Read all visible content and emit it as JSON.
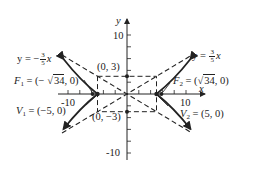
{
  "diagram": {
    "type": "hyperbola",
    "equation_params": {
      "a": 5,
      "b": 3,
      "c": "sqrt(34)",
      "transverse_axis": "x"
    },
    "axes": {
      "x_label": "x",
      "y_label": "y",
      "x_ticks": [
        "-10",
        "10"
      ],
      "y_ticks": [
        "10",
        "-10"
      ]
    },
    "asymptotes": {
      "left": {
        "prefix": "y = −",
        "num": "3",
        "den": "5",
        "suffix": "x"
      },
      "right": {
        "prefix": "y = ",
        "num": "3",
        "den": "5",
        "suffix": "x"
      }
    },
    "points": {
      "top": "(0, 3)",
      "bottom": "(0, −3)",
      "f1": {
        "name": "F",
        "sub": "1",
        "pre": " = (− ",
        "root": "34",
        "post": ", 0)"
      },
      "f2": {
        "name": "F",
        "sub": "2",
        "pre": " = (",
        "root": "34",
        "post": ", 0)"
      },
      "v1": {
        "name": "V",
        "sub": "1",
        "value": " = (−5, 0)"
      },
      "v2": {
        "name": "V",
        "sub": "2",
        "value": " = (5, 0)"
      }
    },
    "colors": {
      "ink": "#222222",
      "background": "#ffffff"
    }
  }
}
